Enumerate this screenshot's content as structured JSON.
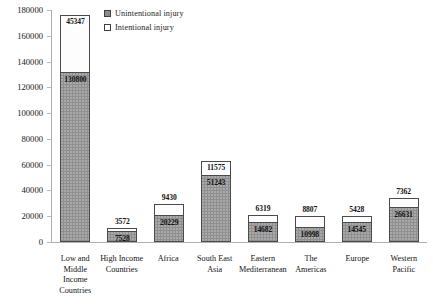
{
  "legend": {
    "items": [
      {
        "label": "Unintentional injury",
        "swatch": "unintentional",
        "color": "#8f8f8f"
      },
      {
        "label": "Intentional injury",
        "swatch": "intentional",
        "color": "#ffffff"
      }
    ]
  },
  "axis": {
    "y_ticks": [
      "180000",
      "160000",
      "140000",
      "120000",
      "100000",
      "80000",
      "60000",
      "40000",
      "20000",
      "0"
    ],
    "y_min": 0,
    "y_max": 180000,
    "y_step": 20000
  },
  "chart_data": {
    "type": "bar",
    "subtype": "stacked-bar",
    "title": "",
    "subtitle": "",
    "xlabel": "",
    "ylabel": "",
    "ylim": [
      0,
      180000
    ],
    "ytick_step": 20000,
    "grid": false,
    "legend_position": "top-center",
    "categories": [
      "Low and Middle Income Countries",
      "High Income Countries",
      "Africa",
      "South East Asia",
      "Eastern Mediterranean",
      "The Americas",
      "Europe",
      "Western Pacific"
    ],
    "category_lines": [
      [
        "Low and",
        "Middle",
        "Income",
        "Countries"
      ],
      [
        "High Income",
        "Countries"
      ],
      [
        "Africa"
      ],
      [
        "South East",
        "Asia"
      ],
      [
        "Eastern",
        "Mediterranean"
      ],
      [
        "The",
        "Americas"
      ],
      [
        "Europe"
      ],
      [
        "Western",
        "Pacific"
      ]
    ],
    "series": [
      {
        "name": "Unintentional injury",
        "values": [
          130800,
          7528,
          20229,
          51243,
          14682,
          10998,
          14545,
          26631
        ]
      },
      {
        "name": "Intentional injury",
        "values": [
          45347,
          3572,
          9430,
          11575,
          6319,
          8807,
          5428,
          7362
        ]
      }
    ],
    "totals": [
      176147,
      11100,
      29659,
      62818,
      21001,
      19805,
      19973,
      33993
    ]
  }
}
